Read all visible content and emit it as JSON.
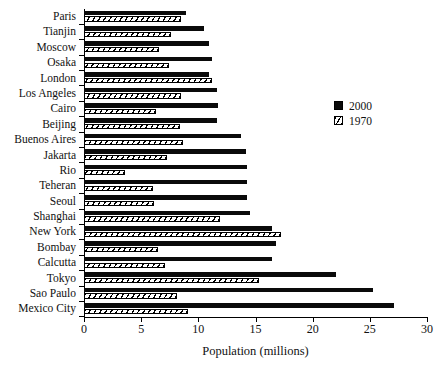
{
  "chart_data": {
    "type": "bar",
    "orientation": "horizontal",
    "title": "",
    "xlabel": "Population (millions)",
    "ylabel": "",
    "xlim": [
      0,
      30
    ],
    "xticks": [
      0,
      5,
      10,
      15,
      20,
      25,
      30
    ],
    "grid": false,
    "legend_position": "right-upper",
    "categories": [
      "Paris",
      "Tianjin",
      "Moscow",
      "Osaka",
      "London",
      "Los Angeles",
      "Cairo",
      "Beijing",
      "Buenos Aires",
      "Jakarta",
      "Rio",
      "Teheran",
      "Seoul",
      "Shanghai",
      "New York",
      "Bombay",
      "Calcutta",
      "Tokyo",
      "Sao Paulo",
      "Mexico City"
    ],
    "series": [
      {
        "name": "2000",
        "style": "solid-black",
        "color": "#0a0a0a",
        "values": [
          8.9,
          10.5,
          10.9,
          11.2,
          10.9,
          11.6,
          11.7,
          11.6,
          13.7,
          14.2,
          14.3,
          14.3,
          14.3,
          14.5,
          16.4,
          16.8,
          16.4,
          22.0,
          25.3,
          27.1
        ]
      },
      {
        "name": "1970",
        "style": "hatched",
        "color": "#ffffff",
        "values": [
          8.5,
          7.6,
          6.6,
          7.4,
          11.2,
          8.5,
          6.3,
          8.4,
          8.7,
          7.3,
          3.6,
          6.0,
          6.1,
          11.9,
          17.2,
          6.5,
          7.1,
          15.3,
          8.1,
          9.1
        ]
      }
    ]
  },
  "legend": {
    "entries": [
      {
        "label": "2000",
        "swatch": "solid"
      },
      {
        "label": "1970",
        "swatch": "hatch"
      }
    ]
  }
}
